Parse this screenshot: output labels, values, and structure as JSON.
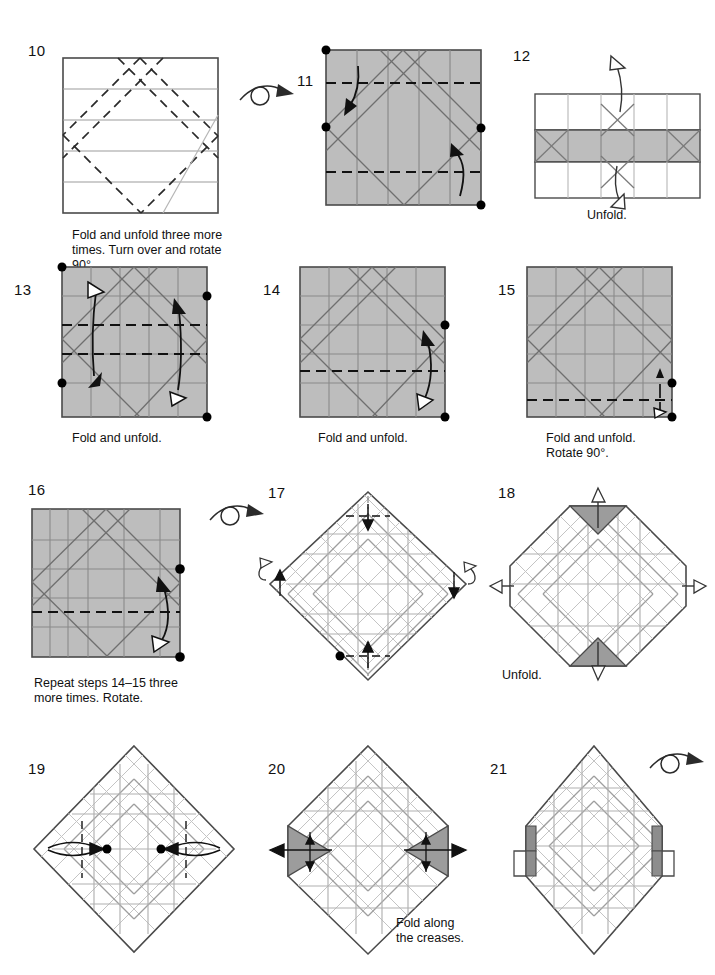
{
  "document": {
    "type": "origami-instruction-diagram",
    "title": "Origami folding sequence steps 10 through 21",
    "page_size": [
      715,
      975
    ],
    "grid": "3 columns x 4 rows"
  },
  "palette": {
    "paper_white": "#ffffff",
    "paper_gray": "#bdbdbd",
    "paper_gray_dark": "#9a9a9a",
    "outline": "#3a3a3a",
    "crease_gray": "#8c8c8c",
    "crease_light": "#c0c0c0",
    "fold_dash": "#1a1a1a",
    "dot": "#000000",
    "text": "#111111"
  },
  "steps": [
    {
      "number": "10",
      "caption": "Fold and unfold three more\ntimes. Turn over and rotate 90°.",
      "shape": "square",
      "fill": "white",
      "has_turn_over_icon": true,
      "icon_name": "turn-over-icon",
      "markings": "four horizontal gray creases, dashed diagonal valley folds forming a diamond"
    },
    {
      "number": "11",
      "caption": "",
      "shape": "square",
      "fill": "gray",
      "has_turn_over_icon": false,
      "markings": "vertical gray creases, diagonal gray creases, two horizontal dashed fold lines, curved fold arrows top-left and bottom-right, four black dots at fold endpoints"
    },
    {
      "number": "12",
      "caption": "Unfold.",
      "shape": "three-band-rectangle",
      "fill": "white with gray middle band",
      "has_turn_over_icon": false,
      "markings": "X creases in bands, hollow unfold arrows pointing up and down"
    },
    {
      "number": "13",
      "caption": "Fold and unfold.",
      "shape": "square",
      "fill": "gray",
      "has_turn_over_icon": false,
      "markings": "two horizontal dashed folds, curved double-ended arrows left and right, four black dots at corners"
    },
    {
      "number": "14",
      "caption": "Fold and unfold.",
      "shape": "square",
      "fill": "gray",
      "has_turn_over_icon": false,
      "markings": "one horizontal dashed fold, curved arrow on right side, two black dots on right edge"
    },
    {
      "number": "15",
      "caption": "Fold and unfold.\nRotate 90°.",
      "shape": "square",
      "fill": "gray",
      "has_turn_over_icon": false,
      "markings": "one low horizontal dashed fold, short double arrow at right edge, two black dots on right edge"
    },
    {
      "number": "16",
      "caption": "Repeat steps 14–15 three\nmore times. Rotate.",
      "shape": "square",
      "fill": "gray",
      "has_turn_over_icon": true,
      "icon_name": "turn-over-icon",
      "markings": "dense crease grid, horizontal dashed fold, curved arrow right side, two black dots on right edge"
    },
    {
      "number": "17",
      "caption": "",
      "shape": "diamond",
      "fill": "white",
      "has_turn_over_icon": false,
      "markings": "full crease tessellation, dash-dot fold lines at four corners, small arrows at top, bottom, left, right, one black dot at lower-left edge"
    },
    {
      "number": "18",
      "caption": "Unfold.",
      "shape": "octagon",
      "fill": "white with gray corner triangles",
      "has_turn_over_icon": false,
      "markings": "gray shaded triangles top and bottom, hollow unfold arrows on all four sides"
    },
    {
      "number": "19",
      "caption": "",
      "shape": "diamond",
      "fill": "white",
      "has_turn_over_icon": false,
      "markings": "crease tessellation, two vertical dashed fold lines, inward arrows from left and right, two black dots"
    },
    {
      "number": "20",
      "caption": "Fold along\nthe creases.",
      "shape": "hex-diamond",
      "fill": "white with gray side triangles",
      "has_turn_over_icon": false,
      "markings": "gray shaded triangles left and right, outward arrows on both sides"
    },
    {
      "number": "21",
      "caption": "",
      "shape": "hex-diamond-folded",
      "fill": "white with gray tabs",
      "has_turn_over_icon": true,
      "icon_name": "turn-over-icon",
      "markings": "side flaps folded in, small gray tabs left and right"
    }
  ]
}
